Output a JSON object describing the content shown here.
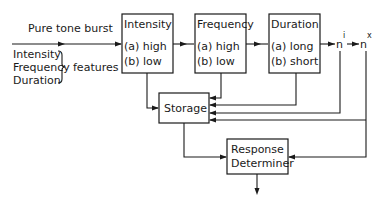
{
  "diagram": {
    "input": {
      "label": "Pure tone burst",
      "features": [
        "Intensity",
        "Frequency",
        "Duration"
      ],
      "features_label": "features"
    },
    "analyzers": [
      {
        "title": "Intensity",
        "options": [
          "(a) high",
          "(b) low"
        ]
      },
      {
        "title": "Frequency",
        "options": [
          "(a) high",
          "(b) low"
        ]
      },
      {
        "title": "Duration",
        "options": [
          "(a) long",
          "(b) short"
        ]
      }
    ],
    "further_analyzers": [
      {
        "base": "n",
        "sup": "i"
      },
      {
        "base": "n",
        "sup": "x"
      }
    ],
    "storage": {
      "label": "Storage"
    },
    "response": {
      "line1": "Response",
      "line2": "Determiner"
    }
  }
}
